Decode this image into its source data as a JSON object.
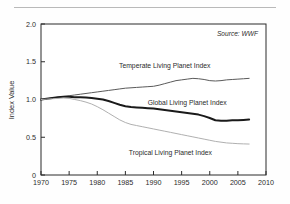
{
  "figure": {
    "source_note": "Source: WWF",
    "has_top_rule": true,
    "background": "#fefefe"
  },
  "chart_data": {
    "type": "line",
    "title": "",
    "xlabel": "",
    "ylabel": "Index Value",
    "xlim": [
      1970,
      2010
    ],
    "ylim": [
      0,
      2.0
    ],
    "grid": false,
    "legend_position": "inline-labels",
    "xticks": [
      1970,
      1975,
      1980,
      1985,
      1990,
      1995,
      2000,
      2005,
      2010
    ],
    "xtick_labels": [
      "1970",
      "1975",
      "1980",
      "1985",
      "1990",
      "1995",
      "2000",
      "2005",
      "2010"
    ],
    "yticks": [
      0,
      0.5,
      1.0,
      1.5,
      2.0
    ],
    "ytick_labels": [
      "0",
      "0.5",
      "1.0",
      "1.5",
      "2.0"
    ],
    "x": [
      1970,
      1971,
      1972,
      1973,
      1974,
      1975,
      1976,
      1977,
      1978,
      1979,
      1980,
      1981,
      1982,
      1983,
      1984,
      1985,
      1986,
      1987,
      1988,
      1989,
      1990,
      1991,
      1992,
      1993,
      1994,
      1995,
      1996,
      1997,
      1998,
      1999,
      2000,
      2001,
      2002,
      2003,
      2004,
      2005,
      2006,
      2007
    ],
    "series": [
      {
        "name": "Temperate Living Planet Index",
        "label": "Temperate Living Planet Index",
        "color": "#5a5a5a",
        "width": 1.0,
        "label_x": 1992,
        "label_y": 1.42,
        "values": [
          1.0,
          1.01,
          1.02,
          1.03,
          1.04,
          1.05,
          1.06,
          1.07,
          1.08,
          1.09,
          1.1,
          1.11,
          1.12,
          1.13,
          1.14,
          1.15,
          1.155,
          1.16,
          1.165,
          1.17,
          1.175,
          1.19,
          1.21,
          1.23,
          1.25,
          1.26,
          1.27,
          1.28,
          1.275,
          1.265,
          1.25,
          1.245,
          1.25,
          1.26,
          1.265,
          1.27,
          1.275,
          1.28
        ]
      },
      {
        "name": "Global Living Planet Index",
        "label": "Global Living Planet Index",
        "color": "#1a1a1a",
        "width": 2.0,
        "label_x": 1996,
        "label_y": 0.93,
        "values": [
          1.0,
          1.01,
          1.02,
          1.03,
          1.035,
          1.035,
          1.03,
          1.03,
          1.025,
          1.02,
          1.01,
          1.0,
          0.98,
          0.955,
          0.93,
          0.91,
          0.9,
          0.895,
          0.89,
          0.885,
          0.88,
          0.87,
          0.86,
          0.85,
          0.84,
          0.83,
          0.82,
          0.81,
          0.8,
          0.78,
          0.755,
          0.725,
          0.72,
          0.72,
          0.725,
          0.725,
          0.73,
          0.735
        ]
      },
      {
        "name": "Tropical Living Planet Index",
        "label": "Tropical Living Planet Index",
        "color": "#b0b0b0",
        "width": 1.0,
        "label_x": 1993,
        "label_y": 0.26,
        "values": [
          1.0,
          1.005,
          1.01,
          1.015,
          1.02,
          1.015,
          1.0,
          0.985,
          0.965,
          0.94,
          0.905,
          0.865,
          0.82,
          0.775,
          0.73,
          0.695,
          0.67,
          0.655,
          0.64,
          0.625,
          0.61,
          0.595,
          0.58,
          0.565,
          0.55,
          0.535,
          0.52,
          0.505,
          0.49,
          0.475,
          0.46,
          0.445,
          0.435,
          0.425,
          0.42,
          0.415,
          0.412,
          0.41
        ]
      }
    ]
  }
}
